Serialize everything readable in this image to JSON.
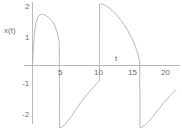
{
  "figure": {
    "background": "#ffffff",
    "width": 182,
    "height": 129
  },
  "axes": {
    "y_title": "x(t)",
    "x_title": "t",
    "line_color": "#9a9a9a",
    "text_color": "#6e6e6e",
    "x_ticks": [
      "5",
      "10",
      "15",
      "20"
    ],
    "y_ticks": [
      "2",
      "1",
      "-1",
      "-2"
    ]
  },
  "chart_data": {
    "type": "line",
    "title": "",
    "xlabel": "t",
    "ylabel": "x(t)",
    "xlim": [
      -0.6,
      21.5
    ],
    "ylim": [
      -2.3,
      2.2
    ],
    "xticks": [
      5,
      10,
      15,
      20
    ],
    "yticks": [
      -2,
      -1,
      1,
      2
    ],
    "grid": false,
    "legend": null,
    "series_color": "#b0b0b0",
    "period": 12,
    "peak_values": [
      1.65,
      2.0
    ],
    "trough_values": [
      -2.0,
      -2.0
    ],
    "discontinuity_times": [
      4.05,
      16.05
    ],
    "jump_times": [
      10.0
    ],
    "x": [
      0,
      0.15,
      0.3,
      0.5,
      0.7,
      0.9,
      1.1,
      1.3,
      1.5,
      1.7,
      1.9,
      2.1,
      2.4,
      2.7,
      3.0,
      3.3,
      3.6,
      3.85,
      4.0,
      4.05,
      4.05,
      4.3,
      4.7,
      5.2,
      5.8,
      6.5,
      7.3,
      8.1,
      9.0,
      9.99,
      10.0,
      10.0,
      10.2,
      10.45,
      10.7,
      11.0,
      11.4,
      11.9,
      12.5,
      13.2,
      13.9,
      14.6,
      15.2,
      15.7,
      16.0,
      16.05,
      16.05,
      16.3,
      16.7,
      17.2,
      17.9,
      18.7,
      19.6,
      20.6,
      21.4
    ],
    "y": [
      0,
      0.62,
      1.05,
      1.35,
      1.5,
      1.58,
      1.63,
      1.65,
      1.65,
      1.64,
      1.62,
      1.6,
      1.55,
      1.49,
      1.41,
      1.3,
      1.13,
      0.93,
      0.74,
      -2.0,
      -2.0,
      -1.99,
      -1.93,
      -1.81,
      -1.64,
      -1.41,
      -1.16,
      -0.94,
      -0.72,
      -0.5,
      1.9,
      1.98,
      1.99,
      1.98,
      1.96,
      1.92,
      1.86,
      1.77,
      1.64,
      1.46,
      1.24,
      0.98,
      0.7,
      0.4,
      0.12,
      -2.0,
      -2.0,
      -1.99,
      -1.94,
      -1.84,
      -1.67,
      -1.44,
      -1.2,
      -0.96,
      -0.78
    ]
  }
}
